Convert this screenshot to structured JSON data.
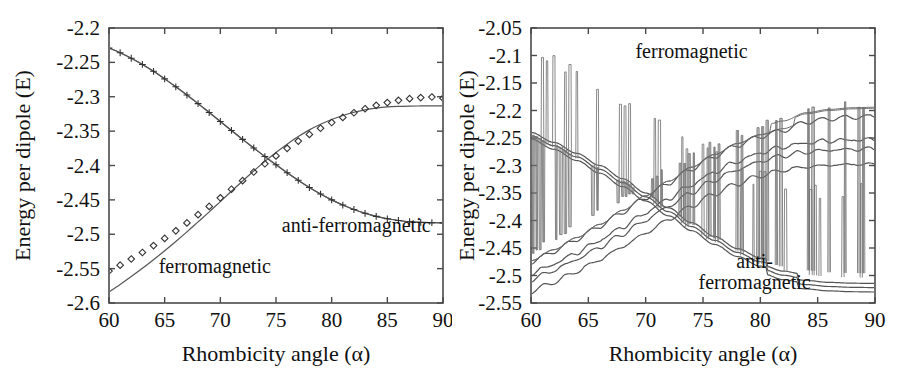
{
  "figure": {
    "background": "#ffffff",
    "curve_color": "#555555",
    "axis_color": "#4a4a4a",
    "text_color": "#111111"
  },
  "panels": [
    {
      "id": "left",
      "xlabel": "Rhombicity angle (α)",
      "ylabel": "Energy per dipole (E)",
      "xticks": [
        60,
        65,
        70,
        75,
        80,
        85,
        90
      ],
      "xtick_labels": [
        "60",
        "65",
        "70",
        "75",
        "80",
        "85",
        "90"
      ],
      "yticks": [
        -2.2,
        -2.25,
        -2.3,
        -2.35,
        -2.4,
        -2.45,
        -2.5,
        -2.55,
        -2.6
      ],
      "ytick_labels": [
        "-2.2",
        "-2.25",
        "-2.3",
        "-2.35",
        "-2.4",
        "-2.45",
        "-2.5",
        "-2.55",
        "-2.6"
      ],
      "xlim": [
        60,
        90
      ],
      "ylim": [
        -2.6,
        -2.2
      ],
      "annotations": [
        {
          "name": "ferromagnetic-label",
          "lines": [
            "ferromagnetic"
          ],
          "x": 69.5,
          "y": -2.556
        },
        {
          "name": "anti-ferromagnetic-label",
          "lines": [
            "anti-ferromagnetic"
          ],
          "x": 82.2,
          "y": -2.497
        }
      ]
    },
    {
      "id": "right",
      "xlabel": "Rhombicity angle (α)",
      "ylabel": "Energy per dipole (E)",
      "xticks": [
        60,
        65,
        70,
        75,
        80,
        85,
        90
      ],
      "xtick_labels": [
        "60",
        "65",
        "70",
        "75",
        "80",
        "85",
        "90"
      ],
      "yticks": [
        -2.05,
        -2.1,
        -2.15,
        -2.2,
        -2.25,
        -2.3,
        -2.35,
        -2.4,
        -2.45,
        -2.5,
        -2.55
      ],
      "ytick_labels": [
        "-2.05",
        "-2.1",
        "-2.15",
        "-2.2",
        "-2.25",
        "-2.3",
        "-2.35",
        "-2.4",
        "-2.45",
        "-2.5",
        "-2.55"
      ],
      "xlim": [
        60,
        90
      ],
      "ylim": [
        -2.55,
        -2.05
      ],
      "annotations": [
        {
          "name": "ferromagnetic-label",
          "lines": [
            "ferromagnetic"
          ],
          "x": 74.0,
          "y": -2.105
        },
        {
          "name": "anti-ferromagnetic-label",
          "lines": [
            "anti-",
            "ferromagnetic"
          ],
          "x": 79.5,
          "y": -2.487
        }
      ]
    }
  ],
  "chart_data": [
    {
      "type": "line",
      "panel": "left",
      "title": "",
      "xlabel": "Rhombicity angle (α)",
      "ylabel": "Energy per dipole (E)",
      "xlim": [
        60,
        90
      ],
      "ylim": [
        -2.6,
        -2.2
      ],
      "grid": false,
      "legend": "in-plot annotations",
      "x": [
        60,
        61,
        62,
        63,
        64,
        65,
        66,
        67,
        68,
        69,
        70,
        71,
        72,
        73,
        74,
        75,
        76,
        77,
        78,
        79,
        80,
        81,
        82,
        83,
        84,
        85,
        86,
        87,
        88,
        89,
        90
      ],
      "series": [
        {
          "name": "ferromagnetic (simulation, + markers)",
          "marker": "plus",
          "line": true,
          "values": [
            -2.229,
            -2.236,
            -2.244,
            -2.253,
            -2.263,
            -2.274,
            -2.2855,
            -2.2975,
            -2.31,
            -2.323,
            -2.336,
            -2.349,
            -2.362,
            -2.3745,
            -2.387,
            -2.399,
            -2.4105,
            -2.4215,
            -2.432,
            -2.4415,
            -2.45,
            -2.4575,
            -2.464,
            -2.4695,
            -2.474,
            -2.4775,
            -2.48,
            -2.4818,
            -2.4828,
            -2.4832,
            -2.4834
          ]
        },
        {
          "name": "anti-ferromagnetic (simulation, diamond markers)",
          "marker": "diamond",
          "line": false,
          "values": [
            -2.5535,
            -2.545,
            -2.536,
            -2.5265,
            -2.5165,
            -2.506,
            -2.495,
            -2.4835,
            -2.4715,
            -2.4595,
            -2.447,
            -2.4345,
            -2.422,
            -2.4095,
            -2.3975,
            -2.386,
            -2.375,
            -2.3645,
            -2.3548,
            -2.3458,
            -2.3375,
            -2.33,
            -2.3233,
            -2.3175,
            -2.3125,
            -2.3085,
            -2.3052,
            -2.3028,
            -2.3012,
            -2.3004,
            -2.302
          ]
        },
        {
          "name": "ferromagnetic (theory, plain line)",
          "marker": "none",
          "line": true,
          "values": [
            -2.229,
            -2.236,
            -2.244,
            -2.253,
            -2.263,
            -2.274,
            -2.2855,
            -2.2975,
            -2.31,
            -2.323,
            -2.336,
            -2.349,
            -2.362,
            -2.3745,
            -2.387,
            -2.399,
            -2.4105,
            -2.4215,
            -2.432,
            -2.4415,
            -2.45,
            -2.4575,
            -2.464,
            -2.4695,
            -2.474,
            -2.4775,
            -2.48,
            -2.4818,
            -2.4828,
            -2.4832,
            -2.4834
          ]
        },
        {
          "name": "anti-ferromagnetic (theory, plain line)",
          "marker": "none",
          "line": true,
          "values": [
            -2.584,
            -2.573,
            -2.5615,
            -2.5495,
            -2.537,
            -2.524,
            -2.5105,
            -2.4965,
            -2.482,
            -2.4675,
            -2.4525,
            -2.4375,
            -2.4225,
            -2.408,
            -2.394,
            -2.381,
            -2.369,
            -2.358,
            -2.3482,
            -2.34,
            -2.333,
            -2.3272,
            -2.3225,
            -2.319,
            -2.3165,
            -2.3148,
            -2.314,
            -2.3136,
            -2.3134,
            -2.3133,
            -2.3133
          ]
        }
      ]
    },
    {
      "type": "line",
      "panel": "right",
      "title": "",
      "xlabel": "Rhombicity angle (α)",
      "ylabel": "Energy per dipole (E)",
      "xlim": [
        60,
        90
      ],
      "ylim": [
        -2.55,
        -2.05
      ],
      "grid": false,
      "legend": "in-plot annotations",
      "note": "Multiple Monte-Carlo replicas; narrow upward energy spikes superposed on each branch",
      "x": [
        60,
        62,
        64,
        66,
        68,
        70,
        72,
        74,
        76,
        78,
        80,
        82,
        84,
        86,
        88,
        90
      ],
      "series": [
        {
          "name": "ferromagnetic branch 1 (descending, spiky)",
          "direction": "descending",
          "values": [
            -2.24,
            -2.258,
            -2.278,
            -2.3,
            -2.324,
            -2.35,
            -2.377,
            -2.404,
            -2.429,
            -2.451,
            -2.468,
            -2.48,
            -2.487,
            -2.4905,
            -2.492,
            -2.4925
          ]
        },
        {
          "name": "ferromagnetic branch 2 (descending, spiky)",
          "direction": "descending",
          "values": [
            -2.246,
            -2.264,
            -2.2845,
            -2.307,
            -2.331,
            -2.357,
            -2.384,
            -2.411,
            -2.436,
            -2.458,
            -2.475,
            -2.4875,
            -2.4945,
            -2.498,
            -2.4995,
            -2.5
          ]
        },
        {
          "name": "ferromagnetic branch 3 (descending, spiky)",
          "direction": "descending",
          "values": [
            -2.252,
            -2.2705,
            -2.291,
            -2.314,
            -2.3385,
            -2.3645,
            -2.3915,
            -2.4185,
            -2.4435,
            -2.4655,
            -2.483,
            -2.4955,
            -2.5025,
            -2.506,
            -2.5075,
            -2.508
          ]
        },
        {
          "name": "anti-ferromagnetic branch 1 (ascending, smooth envelope)",
          "direction": "ascending",
          "values": [
            -2.473,
            -2.453,
            -2.431,
            -2.407,
            -2.3815,
            -2.355,
            -2.3285,
            -2.303,
            -2.28,
            -2.26,
            -2.244,
            -2.233,
            -2.218,
            -2.212,
            -2.209,
            -2.208
          ]
        },
        {
          "name": "anti-ferromagnetic branch 2 (ascending, wiggly)",
          "direction": "ascending",
          "values": [
            -2.499,
            -2.481,
            -2.4605,
            -2.438,
            -2.4135,
            -2.388,
            -2.362,
            -2.337,
            -2.314,
            -2.2945,
            -2.279,
            -2.268,
            -2.261,
            -2.257,
            -2.2555,
            -2.255
          ]
        },
        {
          "name": "anti-ferromagnetic branch 3 (ascending, wiggly)",
          "direction": "ascending",
          "values": [
            -2.51,
            -2.4925,
            -2.4725,
            -2.4505,
            -2.4265,
            -2.4015,
            -2.376,
            -2.351,
            -2.3285,
            -2.3095,
            -2.2945,
            -2.284,
            -2.2775,
            -2.274,
            -2.2725,
            -2.272
          ]
        },
        {
          "name": "anti-ferromagnetic branch 4 (ascending, wiggly)",
          "direction": "ascending",
          "values": [
            -2.531,
            -2.514,
            -2.4945,
            -2.473,
            -2.4495,
            -2.425,
            -2.4,
            -2.3755,
            -2.3535,
            -2.335,
            -2.3205,
            -2.3105,
            -2.3045,
            -2.3015,
            -2.3,
            -2.2995
          ]
        },
        {
          "name": "upper ferromagnetic envelope (spike tops, ascending)",
          "direction": "ascending",
          "values": [
            -2.478,
            -2.458,
            -2.436,
            -2.412,
            -2.3865,
            -2.36,
            -2.3335,
            -2.308,
            -2.285,
            -2.265,
            -2.249,
            -2.238,
            -2.223,
            -2.217,
            -2.214,
            -2.213
          ]
        }
      ]
    }
  ]
}
